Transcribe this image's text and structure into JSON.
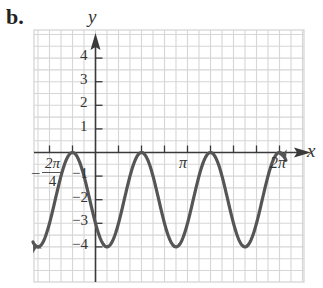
{
  "panel_label": "b.",
  "colors": {
    "grid": "#d6d6d6",
    "axis": "#3a3a3a",
    "curve": "#555555",
    "text": "#333333"
  },
  "chart_data": {
    "type": "line",
    "title": "",
    "xlabel": "x",
    "ylabel": "y",
    "xlim_units_of_pi": [
      -0.875,
      2.25
    ],
    "ylim": [
      -5.5,
      5
    ],
    "grid": true,
    "x_tick_step": "π/4",
    "x_tick_labels": [
      {
        "at_pi": -0.5,
        "label": "-2π/4"
      },
      {
        "at_pi": 1,
        "label": "π"
      },
      {
        "at_pi": 2,
        "label": "2π"
      }
    ],
    "y_ticks": [
      4,
      3,
      2,
      1,
      -1,
      -2,
      -3,
      -4
    ],
    "series": [
      {
        "name": "y = 2cos(8/3·x + 2π/3) - 2",
        "amplitude": 2,
        "midline": -2,
        "period_pi": 0.75,
        "max_at_pi": [
          -0.25,
          0.5,
          1.25,
          2.0
        ],
        "min_at_pi": [
          -0.625,
          0.125,
          0.875,
          1.625
        ],
        "max_value": 0,
        "min_value": -4,
        "arrows_both_ends": true
      }
    ]
  },
  "labels": {
    "x_axis": "x",
    "y_axis": "y",
    "neg_2pi_num": "2π",
    "neg_2pi_den": "4",
    "pi": "π",
    "two_pi": "2π",
    "y_pos": [
      "4",
      "3",
      "2",
      "1"
    ],
    "y_neg": [
      "−1",
      "−2",
      "−3",
      "−4"
    ]
  }
}
